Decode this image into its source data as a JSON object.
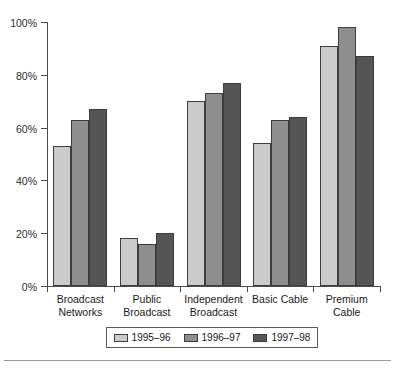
{
  "chart_data": {
    "type": "bar",
    "title": "",
    "xlabel": "",
    "ylabel": "",
    "ylim": [
      0,
      100
    ],
    "grid": false,
    "legend_position": "bottom",
    "categories": [
      "Broadcast\nNetworks",
      "Public\nBroadcast",
      "Independent\nBroadcast",
      "Basic Cable",
      "Premium\nCable"
    ],
    "ytick_labels": [
      "100%",
      "80%",
      "60%",
      "40%",
      "20%",
      "0%"
    ],
    "ytick_values": [
      100,
      80,
      60,
      40,
      20,
      0
    ],
    "series": [
      {
        "name": "1995–96",
        "color": "#cbcbcb",
        "values": [
          53,
          18,
          70,
          54,
          91
        ]
      },
      {
        "name": "1996–97",
        "color": "#8e8e8e",
        "values": [
          63,
          16,
          73,
          63,
          98
        ]
      },
      {
        "name": "1997–98",
        "color": "#555555",
        "values": [
          67,
          20,
          77,
          64,
          87
        ]
      }
    ]
  },
  "legend": {
    "items": [
      {
        "label": "1995–96"
      },
      {
        "label": "1996–97"
      },
      {
        "label": "1997–98"
      }
    ]
  }
}
